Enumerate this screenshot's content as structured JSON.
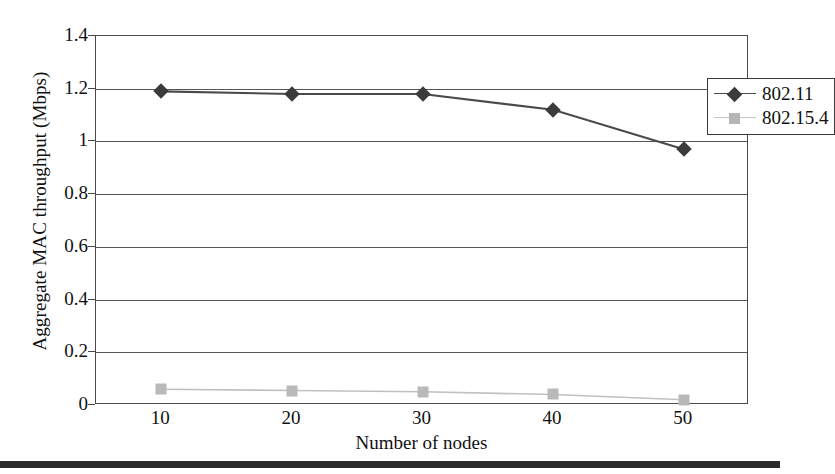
{
  "chart_data": {
    "type": "line",
    "title": "",
    "xlabel": "Number of nodes",
    "ylabel": "Aggregate MAC throughput (Mbps)",
    "categories": [
      10,
      20,
      30,
      40,
      50
    ],
    "x_tick_labels": [
      "10",
      "20",
      "30",
      "40",
      "50"
    ],
    "y_tick_labels": [
      "0",
      "0.2",
      "0.4",
      "0.6",
      "0.8",
      "1",
      "1.2",
      "1.4"
    ],
    "y_tick_values": [
      0,
      0.2,
      0.4,
      0.6,
      0.8,
      1.0,
      1.2,
      1.4
    ],
    "ylim": [
      0,
      1.4
    ],
    "grid": "horizontal",
    "legend_position": "top-right-inside",
    "series": [
      {
        "name": "802.11",
        "marker": "diamond",
        "color": "#3b3b3b",
        "line_color": "#4a4a4a",
        "values": [
          1.19,
          1.18,
          1.18,
          1.12,
          0.97
        ]
      },
      {
        "name": "802.15.4",
        "marker": "square",
        "color": "#b9b9b9",
        "line_color": "#c0c0c0",
        "values": [
          0.06,
          0.055,
          0.05,
          0.04,
          0.02
        ]
      }
    ]
  },
  "legend": {
    "items": [
      {
        "label": "802.11"
      },
      {
        "label": "802.15.4"
      }
    ]
  },
  "colors": {
    "series_1": "#3b3b3b",
    "series_2": "#b9b9b9",
    "axis": "#4a4a4a",
    "grid": "#555555",
    "rule": "#2a2a2a"
  }
}
